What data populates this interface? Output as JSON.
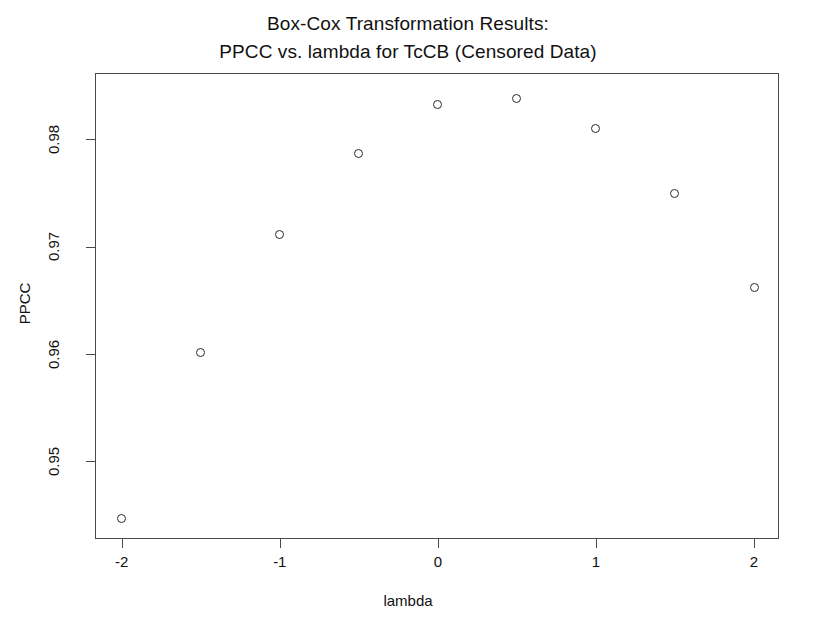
{
  "chart_data": {
    "type": "scatter",
    "title": "Box-Cox Transformation Results:",
    "subtitle": "PPCC vs. lambda for TcCB (Censored Data)",
    "xlabel": "lambda",
    "ylabel": "PPCC",
    "x": [
      -2,
      -1.5,
      -1,
      -0.5,
      0,
      0.5,
      1,
      1.5,
      2
    ],
    "values": [
      0.9446,
      0.9601,
      0.9711,
      0.9787,
      0.9832,
      0.9838,
      0.981,
      0.9749,
      0.9662
    ],
    "series": [
      {
        "name": "PPCC",
        "values": [
          0.9446,
          0.9601,
          0.9711,
          0.9787,
          0.9832,
          0.9838,
          0.981,
          0.9749,
          0.9662
        ]
      }
    ],
    "points": [
      {
        "lambda": -2,
        "ppcc": 0.9446
      },
      {
        "lambda": -1.5,
        "ppcc": 0.9601
      },
      {
        "lambda": -1,
        "ppcc": 0.9711
      },
      {
        "lambda": -0.5,
        "ppcc": 0.9787
      },
      {
        "lambda": 0,
        "ppcc": 0.9832
      },
      {
        "lambda": 0.5,
        "ppcc": 0.9838
      },
      {
        "lambda": 1,
        "ppcc": 0.981
      },
      {
        "lambda": 1.5,
        "ppcc": 0.9749
      },
      {
        "lambda": 2,
        "ppcc": 0.9662
      }
    ],
    "xticks": [
      -2,
      -1,
      0,
      1,
      2
    ],
    "xticklabels": [
      "-2",
      "-1",
      "0",
      "1",
      "2"
    ],
    "yticks": [
      0.95,
      0.96,
      0.97,
      0.98
    ],
    "yticklabels": [
      "0.95",
      "0.96",
      "0.97",
      "0.98"
    ],
    "xlim": [
      -2.31,
      2.31
    ],
    "ylim": [
      0.9424,
      0.9857
    ],
    "grid": false,
    "legend": false,
    "marker": "open-circle",
    "marker_color": "#2b2b2b",
    "background": "#ffffff",
    "axis_color": "#4a4a4a"
  },
  "chart": {
    "title_line1": "Box-Cox Transformation Results:",
    "title_line2": "PPCC vs. lambda for TcCB (Censored Data)",
    "xlabel": "lambda",
    "ylabel": "PPCC"
  }
}
